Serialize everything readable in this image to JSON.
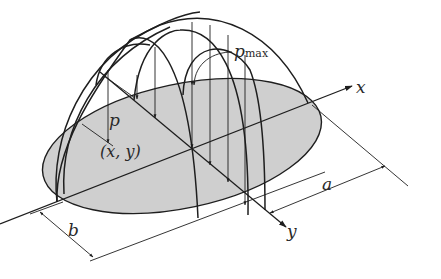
{
  "figure": {
    "colors": {
      "contact_area_fill": "#cfcfcf",
      "line": "#1e1e1e",
      "background": "#ffffff"
    },
    "labels": {
      "pressure_max": "p",
      "pressure_max_subscript": "max",
      "pressure": "p",
      "point": "(x, y)",
      "x_axis": "x",
      "y_axis": "y",
      "semi_axis_a": "a",
      "semi_axis_b": "b"
    }
  }
}
